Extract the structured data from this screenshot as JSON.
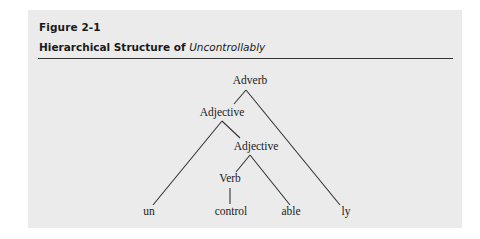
{
  "figure": {
    "label": "Figure 2-1",
    "title_prefix": "Hierarchical Structure of ",
    "title_word": "Uncontrollably"
  },
  "tree": {
    "nodes": {
      "root": "Adverb",
      "adjective_outer": "Adjective",
      "adjective_inner": "Adjective",
      "verb": "Verb"
    },
    "leaves": {
      "prefix": "un",
      "stem": "control",
      "suffix_able": "able",
      "suffix_ly": "ly"
    },
    "edges": [
      [
        "Adverb",
        "Adjective"
      ],
      [
        "Adverb",
        "ly"
      ],
      [
        "Adjective",
        "un"
      ],
      [
        "Adjective",
        "Adjective"
      ],
      [
        "Adjective",
        "Verb"
      ],
      [
        "Adjective",
        "able"
      ],
      [
        "Verb",
        "control"
      ]
    ]
  },
  "colors": {
    "panel_bg": "#ebebeb",
    "text": "#222222",
    "lines": "#333333"
  }
}
